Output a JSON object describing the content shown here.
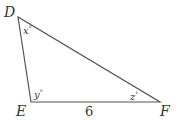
{
  "diagram": {
    "type": "triangle",
    "stroke_color": "#555555",
    "vertices": [
      {
        "name": "D",
        "x": 18,
        "y": 17
      },
      {
        "name": "E",
        "x": 31,
        "y": 102
      },
      {
        "name": "F",
        "x": 160,
        "y": 102
      }
    ],
    "labels": {
      "D": "D",
      "E": "E",
      "F": "F"
    },
    "angles": {
      "D": {
        "var": "x",
        "unit": "°"
      },
      "E": {
        "var": "y",
        "unit": "°"
      },
      "F": {
        "var": "z",
        "unit": "°"
      }
    },
    "sides": {
      "EF": "6"
    }
  }
}
